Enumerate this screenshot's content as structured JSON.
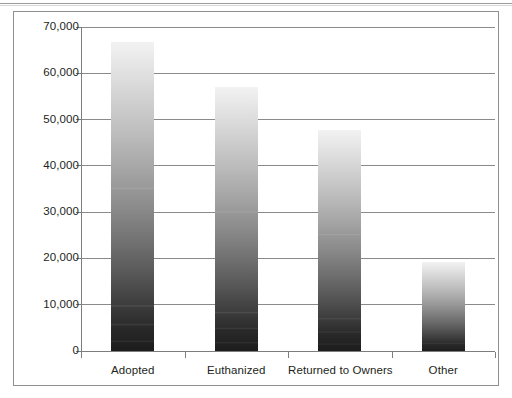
{
  "chart_data": {
    "type": "bar",
    "title": "",
    "subtitle": "",
    "xlabel": "",
    "ylabel": "",
    "categories": [
      "Adopted",
      "Euthanized",
      "Returned to Owners",
      "Other"
    ],
    "values": [
      66700,
      57000,
      47800,
      19200
    ],
    "series": [
      {
        "name": "Outcomes",
        "values": [
          66700,
          57000,
          47800,
          19200
        ]
      }
    ],
    "ylim": [
      0,
      70000
    ],
    "ytick_values": [
      0,
      10000,
      20000,
      30000,
      40000,
      50000,
      60000,
      70000
    ],
    "ytick_labels": [
      "0",
      "10,000",
      "20,000",
      "30,000",
      "40,000",
      "50,000",
      "60,000",
      "70,000"
    ],
    "grid": true,
    "grid_axis": "y",
    "legend": false,
    "legend_position": "none",
    "annotations": [],
    "bar_fill": "vertical-gradient-light-to-dark",
    "bar_color_top": "#f2f2f2",
    "bar_color_bottom": "#1c1c1c"
  },
  "figure": {
    "frame_border_color": "#8f8f8f",
    "background_color": "#ffffff",
    "axis_color": "#7d7d7d",
    "gridline_color": "#8a8a8a",
    "text_color": "#231f20",
    "top_rule_color": "#9a9a9a"
  }
}
